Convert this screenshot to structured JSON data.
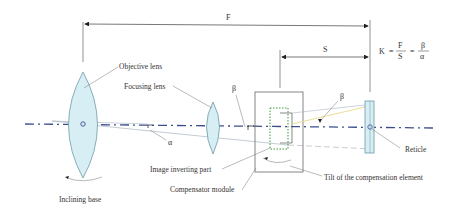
{
  "diagram": {
    "dimensions": {
      "F": "F",
      "S": "S"
    },
    "formula": {
      "lhs": "K",
      "eq1": "=",
      "frac1_num": "F",
      "frac1_den": "S",
      "eq2": "=",
      "frac2_num": "β",
      "frac2_den": "α"
    },
    "angles": {
      "alpha": "α",
      "beta_left": "β",
      "beta_right": "β"
    },
    "labels": {
      "objective_lens": "Objective lens",
      "focusing_lens": "Focusing lens",
      "image_inverting_part": "Image inverting part",
      "compensator_module": "Compensator module",
      "tilt_element": "Tilt of the compensation element",
      "reticle": "Reticle",
      "inclining_base": "Inclining base"
    },
    "colors": {
      "optical_axis": "#3b4f8c",
      "lens_fill": "#d6eef4",
      "lens_stroke": "#6d9aa8",
      "compensator_dots": "#3a9a3a",
      "ray_yellow": "#e8d98a",
      "line": "#666666"
    }
  }
}
